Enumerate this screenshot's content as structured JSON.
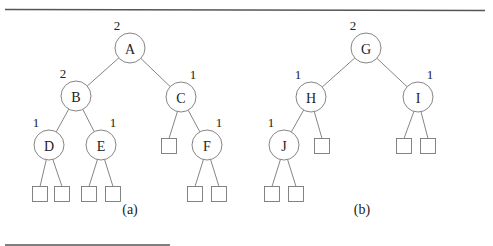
{
  "figure": {
    "trees": [
      {
        "caption": "(a)",
        "nodes": [
          {
            "id": "A",
            "label": "A",
            "rank": "2",
            "parent": null
          },
          {
            "id": "B",
            "label": "B",
            "rank": "2",
            "parent": "A"
          },
          {
            "id": "C",
            "label": "C",
            "rank": "1",
            "parent": "A"
          },
          {
            "id": "D",
            "label": "D",
            "rank": "1",
            "parent": "B"
          },
          {
            "id": "E",
            "label": "E",
            "rank": "1",
            "parent": "B"
          },
          {
            "id": "F",
            "label": "F",
            "rank": "1",
            "parent": "C"
          }
        ],
        "external_leaves": [
          {
            "parent": "C",
            "side": "left"
          },
          {
            "parent": "D",
            "side": "left"
          },
          {
            "parent": "D",
            "side": "right"
          },
          {
            "parent": "E",
            "side": "left"
          },
          {
            "parent": "E",
            "side": "right"
          },
          {
            "parent": "F",
            "side": "left"
          },
          {
            "parent": "F",
            "side": "right"
          }
        ]
      },
      {
        "caption": "(b)",
        "nodes": [
          {
            "id": "G",
            "label": "G",
            "rank": "2",
            "parent": null
          },
          {
            "id": "H",
            "label": "H",
            "rank": "1",
            "parent": "G"
          },
          {
            "id": "I",
            "label": "I",
            "rank": "1",
            "parent": "G"
          },
          {
            "id": "J",
            "label": "J",
            "rank": "1",
            "parent": "H"
          }
        ],
        "external_leaves": [
          {
            "parent": "H",
            "side": "right"
          },
          {
            "parent": "I",
            "side": "left"
          },
          {
            "parent": "I",
            "side": "right"
          },
          {
            "parent": "J",
            "side": "left"
          },
          {
            "parent": "J",
            "side": "right"
          }
        ]
      }
    ]
  }
}
